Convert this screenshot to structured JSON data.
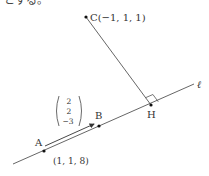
{
  "header_text": "とする。",
  "colors": {
    "line": "#555555",
    "text": "#333333",
    "point": "#111111"
  },
  "points": {
    "C": {
      "label": "C(−1, 1, 1)",
      "x": 86,
      "y": 17
    },
    "H": {
      "label": "H",
      "x": 151,
      "y": 105
    },
    "A": {
      "label": "A",
      "x": 44,
      "y": 151,
      "coord_label": "(1, 1, 8)"
    },
    "B": {
      "label": "B",
      "x": 99,
      "y": 126
    }
  },
  "line_label": "ℓ",
  "direction_vector": {
    "components": [
      "2",
      "2",
      "−3"
    ]
  }
}
